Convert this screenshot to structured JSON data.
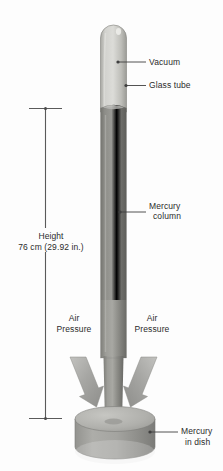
{
  "diagram": {
    "background_color": "#fdfdfd",
    "text_color": "#2b2b2b"
  },
  "labels": {
    "vacuum": "Vacuum",
    "glass_tube": "Glass tube",
    "mercury_column_line1": "Mercury",
    "mercury_column_line2": "column",
    "air_pressure_left_line1": "Air",
    "air_pressure_left_line2": "Pressure",
    "air_pressure_right_line1": "Air",
    "air_pressure_right_line2": "Pressure",
    "mercury_in_dish_line1": "Mercury",
    "mercury_in_dish_line2": "in dish",
    "height_title": "Height",
    "height_value": "76 cm (29.92 in.)"
  },
  "measurements": {
    "height_cm": 76,
    "height_inches": 29.92,
    "unit_metric": "cm",
    "unit_imperial": "in."
  },
  "colors": {
    "vacuum_fill": "#c9c9c4",
    "glass_edge": "#8f8f8a",
    "mercury_dark": "#6e6e6b",
    "mercury_light": "#a3a3a0",
    "dish_top": "#b4b4b0",
    "dish_body": "#8c8c89",
    "arrow_fill": "#a8a8a5",
    "leader_line": "#4a4a4a"
  }
}
